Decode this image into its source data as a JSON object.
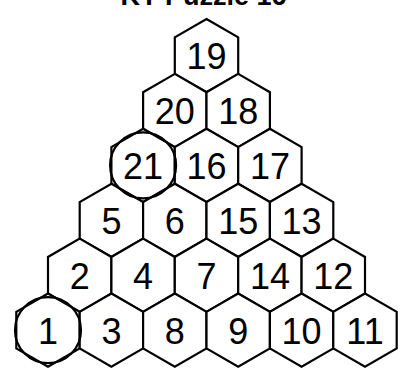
{
  "title": "KY Puzzle 16",
  "puzzle": {
    "rows": [
      [
        {
          "value": "19",
          "circled": false
        }
      ],
      [
        {
          "value": "20",
          "circled": false
        },
        {
          "value": "18",
          "circled": false
        }
      ],
      [
        {
          "value": "21",
          "circled": true
        },
        {
          "value": "16",
          "circled": false
        },
        {
          "value": "17",
          "circled": false
        }
      ],
      [
        {
          "value": "5",
          "circled": false
        },
        {
          "value": "6",
          "circled": false
        },
        {
          "value": "15",
          "circled": false
        },
        {
          "value": "13",
          "circled": false
        }
      ],
      [
        {
          "value": "2",
          "circled": false
        },
        {
          "value": "4",
          "circled": false
        },
        {
          "value": "7",
          "circled": false
        },
        {
          "value": "14",
          "circled": false
        },
        {
          "value": "12",
          "circled": false
        }
      ],
      [
        {
          "value": "1",
          "circled": true
        },
        {
          "value": "3",
          "circled": false
        },
        {
          "value": "8",
          "circled": false
        },
        {
          "value": "9",
          "circled": false
        },
        {
          "value": "10",
          "circled": false
        },
        {
          "value": "11",
          "circled": false
        }
      ]
    ]
  }
}
